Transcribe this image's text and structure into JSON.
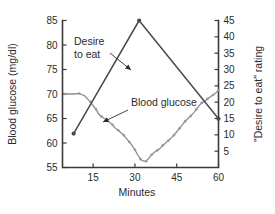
{
  "chart_data": {
    "type": "line",
    "title": "",
    "xlabel": "Minutes",
    "ylabel": "Blood glucose (mg/dl)",
    "y2label": "\"Desire to eat\" rating",
    "grid": false,
    "legend": "annotations",
    "x": [
      5,
      8,
      10,
      12,
      14,
      15,
      16,
      17,
      18,
      19,
      20,
      21,
      22,
      23,
      24,
      25,
      26,
      27,
      28,
      29,
      30,
      31,
      32,
      33,
      34,
      35,
      36,
      37,
      38,
      39,
      40,
      41,
      42,
      43,
      44,
      45,
      46,
      47,
      48,
      49,
      50,
      51,
      52,
      53,
      54,
      55,
      56,
      57,
      58,
      59,
      60
    ],
    "xlim": [
      4,
      60
    ],
    "xticks": [
      15,
      30,
      45,
      60
    ],
    "ylim": [
      55,
      85
    ],
    "yticks": [
      55,
      60,
      65,
      70,
      75,
      80,
      85
    ],
    "y2lim": [
      0,
      45
    ],
    "y2ticks": [
      5,
      10,
      15,
      20,
      25,
      30,
      35,
      40,
      45
    ],
    "series": [
      {
        "name": "Blood glucose",
        "axis": "left",
        "color": "#8e8e8e",
        "markers": true,
        "x": [
          5,
          8,
          10,
          12,
          14,
          15,
          16,
          17,
          18,
          19,
          20,
          21,
          22,
          23,
          24,
          25,
          26,
          27,
          28,
          29,
          30,
          31,
          32,
          33,
          34,
          35,
          36,
          37,
          38,
          39,
          40,
          41,
          42,
          43,
          44,
          45,
          46,
          47,
          48,
          49,
          50,
          51,
          52,
          53,
          54,
          55,
          56,
          57,
          58,
          59,
          60
        ],
        "values": [
          70.0,
          70.0,
          70.1,
          69.6,
          68.4,
          67.6,
          66.9,
          65.9,
          65.4,
          65.0,
          64.6,
          64.2,
          63.7,
          63.0,
          62.6,
          62.1,
          61.6,
          60.9,
          60.2,
          59.5,
          58.6,
          57.6,
          56.7,
          56.3,
          56.3,
          56.9,
          57.6,
          58.1,
          58.5,
          58.9,
          59.5,
          60.0,
          60.5,
          61.0,
          61.6,
          62.3,
          63.0,
          63.7,
          64.4,
          65.0,
          65.5,
          66.1,
          66.8,
          67.6,
          68.2,
          68.5,
          69.0,
          69.4,
          69.8,
          70.2,
          70.8
        ]
      },
      {
        "name": "Desire to eat",
        "axis": "right",
        "color": "#4a4a4a",
        "markers": true,
        "x": [
          8,
          31.5,
          60
        ],
        "values": [
          10.4,
          45.0,
          14.9
        ]
      }
    ],
    "annotations": [
      {
        "name": "desire-to-eat",
        "lines": [
          "Desire",
          "to eat"
        ],
        "text_x": 74,
        "text_y": 45,
        "leader_from_x": 110,
        "leader_from_y": 53,
        "leader_to_x": 131,
        "leader_to_y": 70
      },
      {
        "name": "blood-glucose",
        "lines": [
          "Blood glucose"
        ],
        "text_x": 131,
        "text_y": 106,
        "leader_from_x": 128,
        "leader_from_y": 110,
        "leader_to_x": 103,
        "leader_to_y": 122
      }
    ]
  },
  "axes": {
    "left_title": "Blood glucose (mg/dl)",
    "right_title": "\"Desire to eat\" rating",
    "bottom_title": "Minutes",
    "left_tick_labels": [
      "85",
      "80",
      "75",
      "70",
      "65",
      "60",
      "55"
    ],
    "right_tick_labels": [
      "45",
      "40",
      "35",
      "30",
      "25",
      "20",
      "15",
      "10",
      "5"
    ],
    "bottom_tick_labels": [
      "15",
      "30",
      "45",
      "60"
    ]
  },
  "colors": {
    "glucose_line": "#8e8e8e",
    "desire_line": "#4a4a4a",
    "axis": "#3b3b3b",
    "text": "#2b2b2b",
    "background": "#ffffff"
  }
}
